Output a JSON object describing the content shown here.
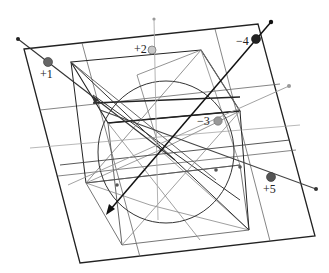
{
  "diagram": {
    "colors": {
      "frame": "#222222",
      "grid": "#555555",
      "light": "#9a9a9a",
      "dark_point": "#333333",
      "mid_point": "#777777",
      "light_point": "#bbbbbb"
    },
    "labels": {
      "p1": "+1",
      "p2": "+2",
      "p3": "−3",
      "p4": "−4",
      "p5": "+5"
    }
  }
}
